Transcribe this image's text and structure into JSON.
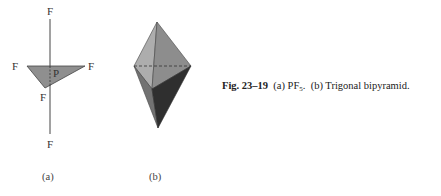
{
  "figure": {
    "panel_a": {
      "atoms": {
        "top": "F",
        "left": "F",
        "right": "F",
        "center": "P",
        "front": "F",
        "bottom": "F"
      },
      "label": "(a)"
    },
    "panel_b": {
      "label": "(b)"
    },
    "caption": {
      "number": "Fig. 23–19",
      "part_a": "(a) PF",
      "part_a_sub": "5",
      "part_a_end": ".",
      "part_b": "(b) Trigonal bipyramid."
    },
    "colors": {
      "triangle_fill": "#8f8f8f",
      "upper_left_face": "#a9a9a9",
      "upper_right_face": "#8c8c8c",
      "lower_left_face": "#6f6f6f",
      "lower_right_face": "#2e2e2e",
      "line": "#444444"
    }
  }
}
